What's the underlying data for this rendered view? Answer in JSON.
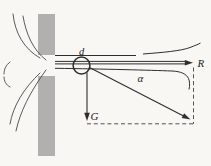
{
  "figure": {
    "labels": {
      "ball_diameter": "d",
      "angle": "α",
      "reaction_force": "R",
      "weight_force": "G"
    },
    "colors": {
      "background": "#f8f7f4",
      "wall": "#b1b0ae",
      "line": "#2e2e2e",
      "stream": "#474747",
      "dash": "#3f3f3f"
    }
  }
}
